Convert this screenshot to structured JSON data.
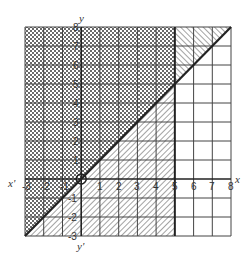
{
  "figure": {
    "type": "graph of linear inequalities",
    "axes": {
      "x_label": "x",
      "x_neg_label": "x'",
      "y_label": "y",
      "y_neg_label": "y'",
      "x_range": [
        -3,
        8
      ],
      "y_range": [
        -3,
        8
      ],
      "x_tick_labels": [
        "-3",
        "-2",
        "-1",
        "1",
        "2",
        "3",
        "4",
        "5",
        "6",
        "7",
        "8"
      ],
      "y_tick_labels": [
        "8",
        "7",
        "6",
        "5",
        "4",
        "3",
        "2",
        "1",
        "-1",
        "-2",
        "-3"
      ],
      "grid": true
    },
    "boundary_lines": [
      {
        "name": "y = x",
        "style": "solid heavy",
        "from": [
          -3,
          -3
        ],
        "to": [
          8,
          8
        ]
      },
      {
        "name": "x = 5",
        "style": "solid heavy",
        "from": [
          5,
          -3
        ],
        "to": [
          5,
          8
        ]
      }
    ],
    "regions": [
      {
        "name": "x <= 5 and y <= x",
        "fill": "forward-diagonal hatch"
      },
      {
        "name": "y >= x and x >= 5",
        "fill": "backward-diagonal hatch"
      },
      {
        "name": "x <= 5 and y >= x",
        "fill": "cross hatch"
      },
      {
        "name": "x >= 5 and y <= x",
        "fill": "unshaded"
      }
    ],
    "origin_marker": "circle",
    "colors": {
      "line": "#222222",
      "grid": "#444444",
      "hatch": "#555555",
      "background": "#ffffff"
    }
  }
}
